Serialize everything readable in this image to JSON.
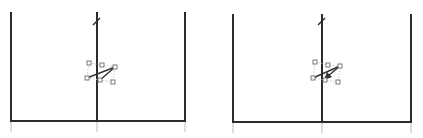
{
  "canvas": {
    "width": 423,
    "height": 138,
    "background": "#ffffff"
  },
  "colors": {
    "wall": "#2b2b2b",
    "tick": "#c8c8c8",
    "handle_stroke": "#6a6a6a",
    "segment": "#333333"
  },
  "panels": [
    {
      "name": "left-panel",
      "left_x": 11,
      "center_x": 97,
      "right_x": 185,
      "top_y": 12,
      "bottom_y": 121,
      "tick_bottom_y": 132,
      "slash": [
        [
          93,
          25
        ],
        [
          100,
          18
        ]
      ],
      "handles": [
        [
          89,
          63
        ],
        [
          102,
          65
        ],
        [
          115,
          67
        ],
        [
          87,
          78
        ],
        [
          100,
          80
        ],
        [
          113,
          82
        ]
      ],
      "segments": [
        [
          [
            87,
            78
          ],
          [
            115,
            67
          ]
        ],
        [
          [
            100,
            80
          ],
          [
            115,
            67
          ]
        ]
      ],
      "arrow": false
    },
    {
      "name": "right-panel",
      "left_x": 233,
      "center_x": 322,
      "right_x": 411,
      "top_y": 14,
      "bottom_y": 122,
      "tick_bottom_y": 133,
      "slash": [
        [
          318,
          25
        ],
        [
          325,
          18
        ]
      ],
      "handles": [
        [
          315,
          62
        ],
        [
          328,
          65
        ],
        [
          340,
          66
        ],
        [
          313,
          78
        ],
        [
          325,
          80
        ],
        [
          338,
          82
        ]
      ],
      "segments": [
        [
          [
            313,
            78
          ],
          [
            340,
            66
          ]
        ],
        [
          [
            340,
            66
          ],
          [
            326,
            78
          ]
        ]
      ],
      "arrow": true
    }
  ]
}
